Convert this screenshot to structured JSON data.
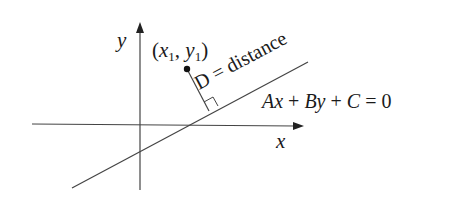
{
  "diagram": {
    "type": "point-to-line distance",
    "axes": {
      "x_label": "x",
      "y_label": "y"
    },
    "point": {
      "label_open": "(",
      "x_sym": "x",
      "x_sub": "1",
      "sep": ", ",
      "y_sym": "y",
      "y_sub": "1",
      "label_close": ")"
    },
    "distance_label": "D = distance",
    "line_equation": {
      "A": "A",
      "x": "x",
      "plus1": " + ",
      "B": "B",
      "y": "y",
      "plus2": " + ",
      "C": "C",
      "eq": " = 0"
    },
    "colors": {
      "stroke": "#333333",
      "text": "#1a1a1a"
    }
  }
}
